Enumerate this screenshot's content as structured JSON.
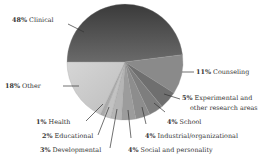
{
  "chart_data": {
    "type": "pie",
    "start_angle_deg": 180,
    "direction": "clockwise",
    "slices": [
      {
        "label": "Clinical",
        "value": 48,
        "pct_text": "48%",
        "color": "#4a4a4a"
      },
      {
        "label": "Counseling",
        "value": 11,
        "pct_text": "11%",
        "color": "#8a8a8a"
      },
      {
        "label": "Experimental and other research areas",
        "value": 5,
        "pct_text": "5%",
        "color": "#6f6f6f"
      },
      {
        "label": "School",
        "value": 4,
        "pct_text": "4%",
        "color": "#7e7e7e"
      },
      {
        "label": "Industrial/organizational",
        "value": 4,
        "pct_text": "4%",
        "color": "#8d8d8d"
      },
      {
        "label": "Social and personality",
        "value": 4,
        "pct_text": "4%",
        "color": "#9c9c9c"
      },
      {
        "label": "Developmental",
        "value": 3,
        "pct_text": "3%",
        "color": "#b5b5b5"
      },
      {
        "label": "Educational",
        "value": 2,
        "pct_text": "2%",
        "color": "#c2c2c2"
      },
      {
        "label": "Health",
        "value": 1,
        "pct_text": "1%",
        "color": "#aaaaaa"
      },
      {
        "label": "Other",
        "value": 18,
        "pct_text": "18%",
        "color": "#cfcfcf"
      }
    ]
  },
  "labels": {
    "clinical": {
      "pct": "48%",
      "text": " Clinical"
    },
    "counseling": {
      "pct": "11%",
      "text": " Counseling"
    },
    "experimental_1": {
      "pct": "5%",
      "text": " Experimental and"
    },
    "experimental_2": {
      "text": "other research areas"
    },
    "school": {
      "pct": "4%",
      "text": " School"
    },
    "industrial": {
      "pct": "4%",
      "text": " Industrial/organizational"
    },
    "social": {
      "pct": "4%",
      "text": " Social and personality"
    },
    "developmental": {
      "pct": "3%",
      "text": " Developmental"
    },
    "educational": {
      "pct": "2%",
      "text": " Educational"
    },
    "health": {
      "pct": "1%",
      "text": " Health"
    },
    "other": {
      "pct": "18%",
      "text": " Other"
    }
  }
}
